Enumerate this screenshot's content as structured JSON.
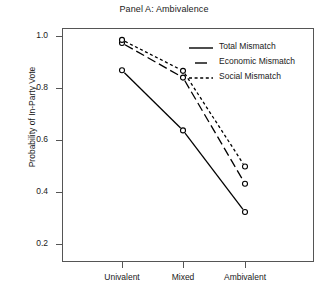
{
  "chart_data": {
    "type": "line",
    "title": "Panel A: Ambivalence",
    "xlabel": "",
    "ylabel": "Probability of In-Party Vote",
    "categories": [
      "Univalent",
      "Mixed",
      "Ambivalent"
    ],
    "ylim": [
      0.2,
      1.0
    ],
    "yticks": [
      "1.0",
      "0.8",
      "0.6",
      "0.4",
      "0.2"
    ],
    "ytick_values": [
      1.0,
      0.8,
      0.6,
      0.4,
      0.2
    ],
    "grid": false,
    "legend_position": "top-right-inside",
    "marker": "open-circle",
    "series": [
      {
        "name": "Total Mismatch",
        "linestyle": "solid",
        "color": "#000000",
        "values": [
          0.868,
          0.637,
          0.323
        ]
      },
      {
        "name": "Economic Mismatch",
        "linestyle": "dashed",
        "color": "#000000",
        "values": [
          0.973,
          0.84,
          0.432
        ]
      },
      {
        "name": "Social Mismatch",
        "linestyle": "dotted",
        "color": "#000000",
        "values": [
          0.985,
          0.866,
          0.498
        ]
      }
    ]
  },
  "axis": {
    "frame_color": "#555555"
  }
}
